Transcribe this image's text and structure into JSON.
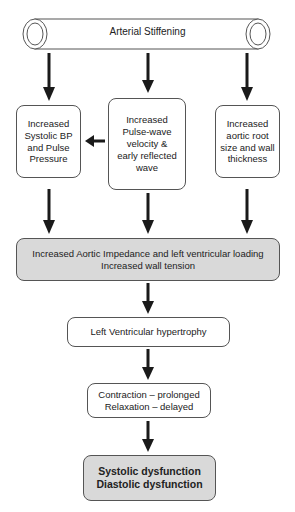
{
  "diagram": {
    "top": {
      "label": "Arterial Stiffening"
    },
    "effects": [
      {
        "lines": [
          "Increased",
          "Systolic BP",
          "and Pulse",
          "Pressure"
        ]
      },
      {
        "lines": [
          "Increased",
          "Pulse-wave",
          "velocity &",
          "early reflected",
          "wave"
        ]
      },
      {
        "lines": [
          "Increased",
          "aortic root",
          "size and wall",
          "thickness"
        ]
      }
    ],
    "impedance": {
      "lines": [
        "Increased Aortic Impedance and left ventricular loading",
        "Increased wall tension"
      ]
    },
    "lvh": {
      "label": "Left Ventricular hypertrophy"
    },
    "timing": {
      "lines": [
        "Contraction – prolonged",
        "Relaxation – delayed"
      ]
    },
    "outcome": {
      "lines": [
        "Systolic dysfunction",
        "Diastolic dysfunction"
      ]
    },
    "colors": {
      "box_fill": "#ffffff",
      "highlight_fill": "#d9d9d9",
      "stroke": "#555555",
      "arrow": "#1a1a1a"
    }
  }
}
